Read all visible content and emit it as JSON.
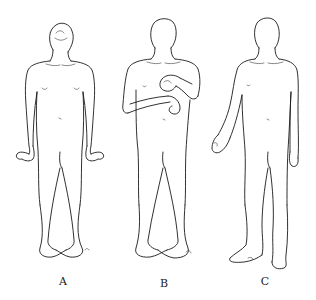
{
  "figure": {
    "panels": [
      {
        "id": "A",
        "label": "A",
        "posture": "head tilted back, wrists flexed outward, legs crossed (scissoring)"
      },
      {
        "id": "B",
        "label": "B",
        "posture": "arms flexed across chest, hands curled, legs crossed"
      },
      {
        "id": "C",
        "label": "C",
        "posture": "one arm flexed at side with hand curled, one leg extended with foot plantarflexed"
      }
    ]
  },
  "colors": {
    "background": "#ffffff",
    "line": "#1a1a1a"
  }
}
